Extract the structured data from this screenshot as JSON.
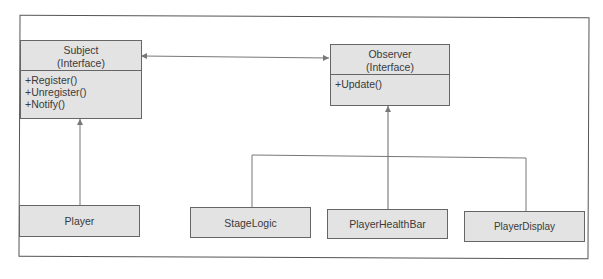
{
  "diagram": {
    "type": "uml-class-diagram",
    "pattern": "Observer",
    "classes": {
      "subject": {
        "name": "Subject",
        "stereotype": "(Interface)",
        "operations": [
          "+Register()",
          "+Unregister()",
          "+Notify()"
        ]
      },
      "observer": {
        "name": "Observer",
        "stereotype": "(Interface)",
        "operations": [
          "+Update()"
        ]
      },
      "player": {
        "name": "Player"
      },
      "stage_logic": {
        "name": "StageLogic"
      },
      "player_health_bar": {
        "name": "PlayerHealthBar"
      },
      "player_display": {
        "name": "PlayerDisplay"
      }
    },
    "relationships": [
      {
        "from": "Subject",
        "to": "Observer",
        "type": "bidirectional-association"
      },
      {
        "from": "Player",
        "to": "Subject",
        "type": "realization"
      },
      {
        "from": "StageLogic",
        "to": "Observer",
        "type": "realization"
      },
      {
        "from": "PlayerHealthBar",
        "to": "Observer",
        "type": "realization"
      },
      {
        "from": "PlayerDisplay",
        "to": "Observer",
        "type": "realization"
      }
    ],
    "colors": {
      "box_fill": "#e3e3e3",
      "box_border": "#666666",
      "line": "#666666",
      "frame": "#555555"
    }
  }
}
